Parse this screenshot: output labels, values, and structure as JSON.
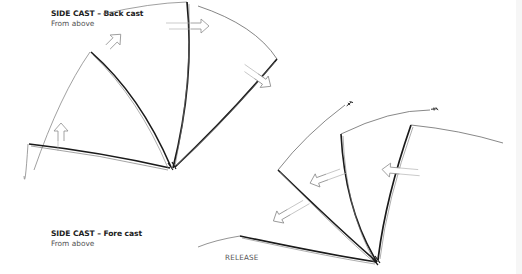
{
  "back_cast": {
    "title": "SIDE CAST – Back cast",
    "subtitle": "From above"
  },
  "fore_cast": {
    "title": "SIDE CAST – Fore cast",
    "subtitle": "From above",
    "release_label": "RELEASE"
  },
  "colors": {
    "rod_line": "#1a1a1a",
    "fly_line": "#555555",
    "arrow": "#9a9a9a"
  },
  "icons": [
    "arrow-up-icon",
    "arrow-right-icon",
    "arrow-left-icon",
    "fly-icon"
  ]
}
